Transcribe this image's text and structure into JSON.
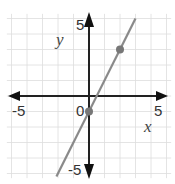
{
  "chart_data": {
    "type": "line",
    "title": "",
    "xlabel": "x",
    "ylabel": "y",
    "xlim": [
      -5,
      5
    ],
    "ylim": [
      -5,
      5
    ],
    "grid": true,
    "tick_labels": {
      "x_neg": "-5",
      "x_pos": "5",
      "y_pos": "5",
      "y_neg": "-5",
      "origin": "0"
    },
    "series": [
      {
        "name": "line",
        "equation": "y = 2x - 1",
        "slope": 2,
        "intercept": -1,
        "x": [
          -2.1,
          3
        ],
        "y": [
          -5.2,
          5
        ]
      }
    ],
    "points": [
      {
        "x": 0,
        "y": -1
      },
      {
        "x": 2,
        "y": 3
      }
    ],
    "colors": {
      "axis": "#222222",
      "grid": "#dddddd",
      "line": "#8a8a8a",
      "point": "#777777"
    }
  }
}
